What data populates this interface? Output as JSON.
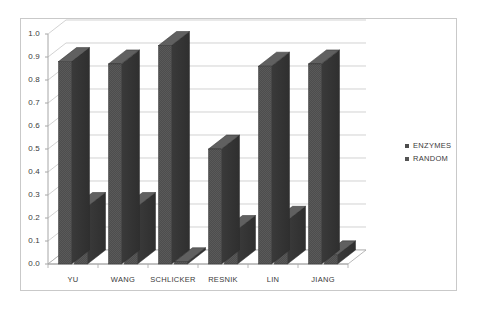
{
  "chart_data": {
    "type": "bar",
    "title": "",
    "subtitle": "",
    "xlabel": "",
    "ylabel": "",
    "categories": [
      "YU",
      "WANG",
      "SCHLICKER",
      "RESNIK",
      "LIN",
      "JIANG"
    ],
    "series": [
      {
        "name": "ENZYMES",
        "values": [
          0.88,
          0.87,
          0.95,
          0.5,
          0.86,
          0.87
        ],
        "color": "#4d4d4d"
      },
      {
        "name": "RANDOM",
        "values": [
          0.25,
          0.25,
          0.01,
          0.15,
          0.19,
          0.04
        ],
        "color": "#545454"
      }
    ],
    "ylim": [
      0.0,
      1.0
    ],
    "ytick_labels": [
      "1.0",
      "0.9",
      "0.8",
      "0.7",
      "0.6",
      "0.5",
      "0.4",
      "0.3",
      "0.2",
      "0.1",
      "0.0"
    ],
    "ytick_values": [
      1.0,
      0.9,
      0.8,
      0.7,
      0.6,
      0.5,
      0.4,
      0.3,
      0.2,
      0.1,
      0.0
    ],
    "grid": true,
    "grid_axis": "y",
    "legend_position": "right",
    "style": "3d-column",
    "background_color": "#ffffff",
    "grid_color": "#bfbfbf",
    "axis_color": "#a6a6a6",
    "border_color": "#c9c9c9",
    "text_color": "#3a3a3a"
  },
  "legend": {
    "items": [
      {
        "label": "ENZYMES",
        "marker": "square-marker"
      },
      {
        "label": "RANDOM",
        "marker": "square-marker"
      }
    ]
  }
}
